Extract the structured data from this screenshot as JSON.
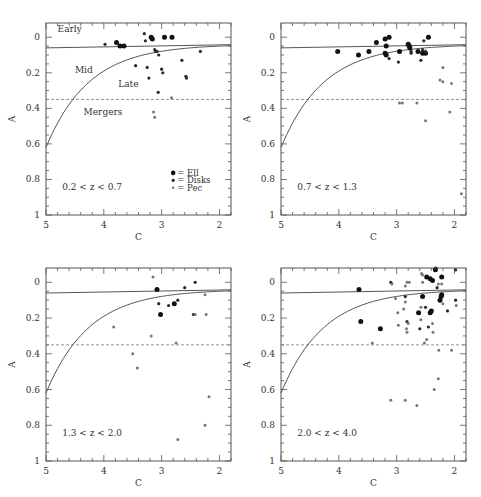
{
  "figure": {
    "shared": {
      "xlabel": "C",
      "ylabel": "A",
      "xlim": [
        5,
        1.8
      ],
      "ylim": [
        1,
        -0.08
      ],
      "xticks": [
        5,
        4,
        3,
        2
      ],
      "yticks": [
        0,
        0.2,
        0.4,
        0.6,
        0.8,
        1
      ],
      "ytick_labels": [
        "0",
        "0.2",
        "0.4",
        "0.6",
        "0.8",
        "1"
      ],
      "xtick_labels": [
        "5",
        "4",
        "3",
        "2"
      ],
      "region_labels": {
        "early": "Early",
        "mid": "Mid",
        "late": "Late",
        "mergers": "Mergers"
      },
      "legend": [
        {
          "label": "= Ell",
          "class": "ell"
        },
        {
          "label": "= Disks",
          "class": "disk"
        },
        {
          "label": "= Pec",
          "class": "pec"
        }
      ],
      "colors": {
        "ell": "#111111",
        "disk": "#2a2a2a",
        "pec": "#777777",
        "axis": "#555555",
        "line": "#555555",
        "dash": "#888888"
      }
    }
  },
  "chart_data": [
    {
      "type": "scatter",
      "title": "0.2 < z < 0.7",
      "xlabel": "C",
      "ylabel": "A",
      "xlim": [
        5,
        1.8
      ],
      "ylim": [
        1,
        -0.08
      ],
      "legend_position": "lower right",
      "boundaries": {
        "early_mid_line": "A ≈ 0.06 (nearly flat, slight decline to 0.04 at C=1.8)",
        "mergers_dashed": 0.35,
        "mid_late_curve": "from A=0.62 at C=5 to A=0.04 at C=1.8"
      },
      "series": [
        {
          "name": "Ell",
          "points": [
            [
              3.78,
              0.03
            ],
            [
              3.72,
              0.05
            ],
            [
              3.65,
              0.05
            ],
            [
              3.18,
              0.0
            ],
            [
              3.16,
              0.01
            ],
            [
              2.95,
              0.0
            ],
            [
              2.82,
              0.0
            ]
          ]
        },
        {
          "name": "Disks",
          "points": [
            [
              3.98,
              0.04
            ],
            [
              3.28,
              0.02
            ],
            [
              3.12,
              0.07
            ],
            [
              3.1,
              0.08
            ],
            [
              3.08,
              0.08
            ],
            [
              3.05,
              0.1
            ],
            [
              3.45,
              0.16
            ],
            [
              3.25,
              0.17
            ],
            [
              3.22,
              0.23
            ],
            [
              3.0,
              0.18
            ],
            [
              2.98,
              0.2
            ],
            [
              2.65,
              0.13
            ],
            [
              2.58,
              0.22
            ],
            [
              2.57,
              0.23
            ],
            [
              2.33,
              0.08
            ],
            [
              3.06,
              0.31
            ],
            [
              3.3,
              -0.02
            ]
          ]
        },
        {
          "name": "Pec",
          "points": [
            [
              2.83,
              0.34
            ],
            [
              3.14,
              0.42
            ],
            [
              3.12,
              0.45
            ]
          ]
        }
      ]
    },
    {
      "type": "scatter",
      "title": "0.7 < z < 1.3",
      "xlabel": "C",
      "ylabel": "A",
      "xlim": [
        5,
        1.8
      ],
      "ylim": [
        1,
        -0.08
      ],
      "series": [
        {
          "name": "Ell",
          "points": [
            [
              4.02,
              0.08
            ],
            [
              3.66,
              0.1
            ],
            [
              3.48,
              0.08
            ],
            [
              3.35,
              0.03
            ],
            [
              3.2,
              0.01
            ],
            [
              3.18,
              0.05
            ],
            [
              3.13,
              0.0
            ],
            [
              3.2,
              0.09
            ],
            [
              3.18,
              0.1
            ],
            [
              2.95,
              0.08
            ],
            [
              2.8,
              0.04
            ],
            [
              2.78,
              0.05
            ],
            [
              2.77,
              0.06
            ],
            [
              2.63,
              0.08
            ],
            [
              2.55,
              0.09
            ],
            [
              2.5,
              0.09
            ],
            [
              2.45,
              0.0
            ]
          ]
        },
        {
          "name": "Disks",
          "points": [
            [
              3.13,
              0.12
            ],
            [
              2.97,
              0.14
            ],
            [
              2.75,
              0.08
            ],
            [
              2.75,
              0.09
            ],
            [
              2.58,
              0.13
            ],
            [
              2.53,
              0.02
            ],
            [
              2.55,
              0.07
            ],
            [
              2.5,
              0.08
            ]
          ]
        },
        {
          "name": "Pec",
          "points": [
            [
              2.95,
              0.37
            ],
            [
              2.9,
              0.37
            ],
            [
              2.65,
              0.37
            ],
            [
              2.5,
              0.47
            ],
            [
              2.25,
              0.24
            ],
            [
              2.2,
              0.25
            ],
            [
              2.2,
              0.17
            ],
            [
              2.05,
              0.26
            ],
            [
              2.08,
              0.42
            ],
            [
              1.88,
              0.88
            ]
          ]
        }
      ]
    },
    {
      "type": "scatter",
      "title": "1.3 < z < 2.0",
      "xlabel": "C",
      "ylabel": "A",
      "xlim": [
        5,
        1.8
      ],
      "ylim": [
        1,
        -0.08
      ],
      "series": [
        {
          "name": "Ell",
          "points": [
            [
              3.08,
              0.04
            ],
            [
              3.02,
              0.18
            ],
            [
              2.78,
              0.12
            ]
          ]
        },
        {
          "name": "Disks",
          "points": [
            [
              2.88,
              0.13
            ],
            [
              2.72,
              0.1
            ],
            [
              2.6,
              0.03
            ],
            [
              2.42,
              0.0
            ],
            [
              2.45,
              0.18
            ],
            [
              3.05,
              0.12
            ]
          ]
        },
        {
          "name": "Pec",
          "points": [
            [
              3.15,
              -0.03
            ],
            [
              3.83,
              0.25
            ],
            [
              3.18,
              0.3
            ],
            [
              2.75,
              0.34
            ],
            [
              3.5,
              0.4
            ],
            [
              3.42,
              0.48
            ],
            [
              2.42,
              0.18
            ],
            [
              2.25,
              0.07
            ],
            [
              2.23,
              0.18
            ],
            [
              2.18,
              0.64
            ],
            [
              2.25,
              0.8
            ],
            [
              2.72,
              0.88
            ]
          ]
        }
      ]
    },
    {
      "type": "scatter",
      "title": "2.0 < z < 4.0",
      "xlabel": "C",
      "ylabel": "A",
      "xlim": [
        5,
        1.8
      ],
      "ylim": [
        1,
        -0.08
      ],
      "series": [
        {
          "name": "Ell",
          "points": [
            [
              3.65,
              0.04
            ],
            [
              3.62,
              0.22
            ],
            [
              3.28,
              0.26
            ],
            [
              2.62,
              0.17
            ],
            [
              2.55,
              0.08
            ],
            [
              2.48,
              -0.03
            ],
            [
              2.42,
              -0.02
            ],
            [
              2.38,
              -0.01
            ],
            [
              2.33,
              -0.07
            ],
            [
              2.22,
              -0.03
            ],
            [
              2.42,
              0.17
            ],
            [
              2.4,
              0.16
            ],
            [
              2.23,
              0.08
            ],
            [
              2.22,
              0.07
            ],
            [
              2.25,
              0.1
            ]
          ]
        },
        {
          "name": "Disks",
          "points": [
            [
              3.1,
              0.0
            ],
            [
              2.85,
              0.08
            ],
            [
              2.82,
              0.22
            ],
            [
              2.6,
              0.26
            ],
            [
              2.5,
              0.14
            ],
            [
              2.45,
              0.25
            ],
            [
              2.3,
              0.03
            ],
            [
              2.32,
              -0.08
            ],
            [
              2.12,
              0.16
            ],
            [
              1.98,
              0.1
            ],
            [
              1.98,
              -0.07
            ]
          ]
        },
        {
          "name": "Pec",
          "points": [
            [
              3.08,
              0.01
            ],
            [
              3.02,
              0.09
            ],
            [
              2.98,
              0.17
            ],
            [
              2.97,
              0.24
            ],
            [
              2.88,
              0.15
            ],
            [
              2.85,
              0.11
            ],
            [
              2.85,
              0.02
            ],
            [
              2.82,
              0.0
            ],
            [
              2.78,
              0.0
            ],
            [
              2.8,
              0.23
            ],
            [
              2.83,
              0.26
            ],
            [
              2.82,
              0.28
            ],
            [
              2.55,
              0.0
            ],
            [
              2.57,
              -0.05
            ],
            [
              2.55,
              -0.04
            ],
            [
              2.58,
              0.14
            ],
            [
              2.58,
              0.21
            ],
            [
              2.52,
              0.34
            ],
            [
              2.48,
              0.32
            ],
            [
              2.38,
              0.23
            ],
            [
              2.37,
              0.28
            ],
            [
              2.28,
              0.01
            ],
            [
              2.22,
              0.01
            ],
            [
              2.2,
              0.12
            ],
            [
              2.27,
              0.38
            ],
            [
              2.28,
              0.54
            ],
            [
              2.35,
              0.6
            ],
            [
              2.05,
              0.38
            ],
            [
              1.97,
              0.13
            ],
            [
              3.42,
              0.34
            ],
            [
              3.1,
              0.66
            ],
            [
              2.85,
              0.66
            ],
            [
              2.65,
              0.69
            ]
          ]
        }
      ]
    }
  ]
}
